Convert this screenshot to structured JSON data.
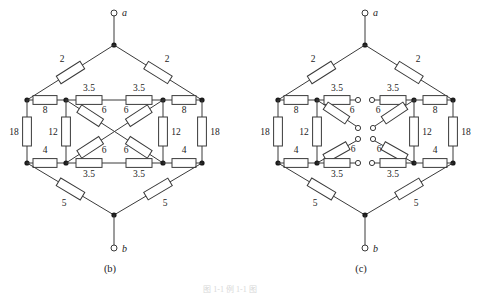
{
  "figure": {
    "caption_faint": "图 1-1  例 1-1 图",
    "subcaptions": [
      {
        "id": "b",
        "label": "(b)"
      },
      {
        "id": "c",
        "label": "(c)"
      }
    ]
  },
  "terminals": {
    "top_label": "a",
    "bottom_label": "b"
  },
  "circuit_b": {
    "name": "bridged-network-with-crossed-diagonals",
    "terminal_top": "a",
    "terminal_bottom": "b",
    "resistors": {
      "top_left_branch": "2",
      "top_right_branch": "2",
      "bottom_left_branch": "5",
      "bottom_right_branch": "5",
      "upper_left_series": "8",
      "upper_right_series": "8",
      "lower_left_series": "4",
      "lower_right_series": "4",
      "outer_left_shunt": "18",
      "outer_right_shunt": "18",
      "inner_left_shunt": "12",
      "inner_right_shunt": "12",
      "top_rail_left": "3.5",
      "top_rail_right": "3.5",
      "bottom_rail_left": "3.5",
      "bottom_rail_right": "3.5",
      "diagonal_upper_left": "6",
      "diagonal_upper_right": "6",
      "diagonal_lower_left": "6",
      "diagonal_lower_right": "6"
    }
  },
  "circuit_c": {
    "name": "bridged-network-with-open-diagonals",
    "terminal_top": "a",
    "terminal_bottom": "b",
    "resistors": {
      "top_left_branch": "2",
      "top_right_branch": "2",
      "bottom_left_branch": "5",
      "bottom_right_branch": "5",
      "upper_left_series": "8",
      "upper_right_series": "8",
      "lower_left_series": "4",
      "lower_right_series": "4",
      "outer_left_shunt": "18",
      "outer_right_shunt": "18",
      "inner_left_shunt": "12",
      "inner_right_shunt": "12",
      "top_rail_left": "3.5",
      "top_rail_right": "3.5",
      "bottom_rail_left": "3.5",
      "bottom_rail_right": "3.5",
      "diagonal_upper_left": "6",
      "diagonal_upper_right": "6",
      "diagonal_lower_left": "6",
      "diagonal_lower_right": "6"
    }
  }
}
